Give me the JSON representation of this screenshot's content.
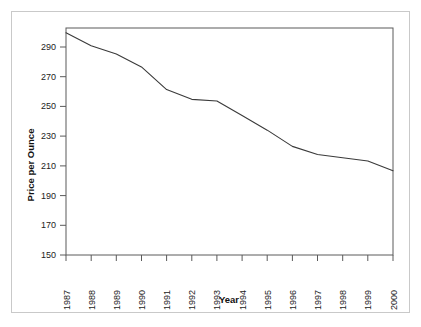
{
  "chart_data": {
    "type": "line",
    "title": "",
    "subtitle": "",
    "xlabel": "Year",
    "ylabel": "Price per Ounce",
    "x": [
      1987,
      1988,
      1989,
      1990,
      1991,
      1992,
      1993,
      1994,
      1995,
      1996,
      1997,
      1998,
      1999,
      2000
    ],
    "categories": [
      "1987",
      "1988",
      "1989",
      "1990",
      "1991",
      "1992",
      "1993",
      "1994",
      "1995",
      "1996",
      "1997",
      "1998",
      "1999",
      "2000"
    ],
    "values": [
      287,
      279,
      274,
      266,
      252,
      246,
      245,
      236,
      227,
      217,
      212,
      210,
      208,
      202
    ],
    "series": [
      {
        "name": "Price per Ounce",
        "values": [
          287,
          279,
          274,
          266,
          252,
          246,
          245,
          236,
          227,
          217,
          212,
          210,
          208,
          202
        ]
      }
    ],
    "xlim": [
      1987,
      2000
    ],
    "ylim": [
      150,
      290
    ],
    "ytick_labels": [
      "150",
      "170",
      "190",
      "210",
      "230",
      "250",
      "270",
      "290"
    ],
    "yticks": [
      150,
      170,
      190,
      210,
      230,
      250,
      270,
      290
    ],
    "xtick_labels": [
      "1987",
      "1988",
      "1989",
      "1990",
      "1991",
      "1992",
      "1993",
      "1994",
      "1995",
      "1996",
      "1997",
      "1998",
      "1999",
      "2000"
    ],
    "grid": false,
    "legend": false,
    "legend_position": "none",
    "line_color": "#3a3a3a",
    "axis_color": "#555555",
    "background_color": "#ffffff",
    "frame_color": "#c9c9c9",
    "xtick_rotation": -90
  },
  "axes": {
    "y_title": "Price per Ounce",
    "x_title": "Year"
  }
}
